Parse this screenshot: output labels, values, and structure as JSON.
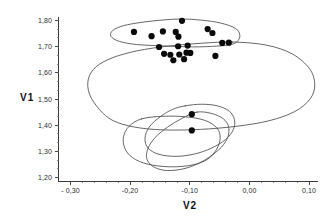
{
  "chart_data": {
    "type": "scatter",
    "title": "",
    "xlabel": "V2",
    "ylabel": "V1",
    "xlim": [
      -0.32,
      0.115
    ],
    "ylim": [
      1.185,
      1.815
    ],
    "grid": false,
    "legend": "none",
    "xticks": [
      -0.3,
      -0.2,
      -0.1,
      0.0,
      0.1
    ],
    "xtick_labels": [
      "- 0,30",
      "-0,20",
      "-0,10",
      "0,00",
      "0,10"
    ],
    "yticks": [
      1.2,
      1.3,
      1.4,
      1.5,
      1.6,
      1.7,
      1.8
    ],
    "ytick_labels": [
      "1,20",
      "1,30",
      "1,40",
      "1,50",
      "1,60",
      "1,70",
      "1,80"
    ],
    "x_minor_tick_count": 4,
    "y_minor_tick_count": 2,
    "marker": "filled-circle",
    "marker_color": "#0a0a0a",
    "marker_size_px": 3.1,
    "hull_stroke_color": "#4b4b4b",
    "axis_color": "#3a3a3a",
    "series": [
      {
        "name": "group-upper",
        "points": [
          [
            -0.113,
            1.7985
          ],
          [
            -0.1935,
            1.756
          ],
          [
            -0.164,
            1.74
          ],
          [
            -0.145,
            1.758
          ],
          [
            -0.1235,
            1.756
          ],
          [
            -0.119,
            1.738
          ],
          [
            -0.07,
            1.767
          ],
          [
            -0.062,
            1.752
          ],
          [
            -0.1515,
            1.6985
          ],
          [
            -0.1195,
            1.7015
          ],
          [
            -0.1035,
            1.704
          ],
          [
            -0.0455,
            1.714
          ],
          [
            -0.0345,
            1.715
          ],
          [
            -0.143,
            1.6725
          ],
          [
            -0.1325,
            1.669
          ],
          [
            -0.1275,
            1.648
          ],
          [
            -0.1175,
            1.67
          ],
          [
            -0.1055,
            1.677
          ],
          [
            -0.099,
            1.676
          ],
          [
            -0.1095,
            1.652
          ],
          [
            -0.057,
            1.6645
          ]
        ]
      },
      {
        "name": "group-lower",
        "points": [
          [
            -0.0965,
            1.442
          ],
          [
            -0.0965,
            1.38
          ]
        ]
      }
    ],
    "hulls": [
      {
        "name": "hull-upper-cluster",
        "vertices": [
          [
            -0.113,
            1.8055
          ],
          [
            -0.08,
            1.801
          ],
          [
            -0.048,
            1.79
          ],
          [
            -0.023,
            1.769
          ],
          [
            -0.016,
            1.743
          ],
          [
            -0.021,
            1.718
          ],
          [
            -0.035,
            1.706
          ],
          [
            -0.062,
            1.701
          ],
          [
            -0.095,
            1.699
          ],
          [
            -0.142,
            1.7025
          ],
          [
            -0.189,
            1.708
          ],
          [
            -0.218,
            1.72
          ],
          [
            -0.232,
            1.739
          ],
          [
            -0.229,
            1.762
          ],
          [
            -0.211,
            1.78
          ],
          [
            -0.18,
            1.793
          ],
          [
            -0.146,
            1.8015
          ]
        ]
      },
      {
        "name": "hull-middle-large",
        "vertices": [
          [
            -0.028,
            1.7175
          ],
          [
            0.028,
            1.706
          ],
          [
            0.072,
            1.672
          ],
          [
            0.101,
            1.615
          ],
          [
            0.1095,
            1.555
          ],
          [
            0.102,
            1.501
          ],
          [
            0.076,
            1.452
          ],
          [
            0.033,
            1.417
          ],
          [
            -0.021,
            1.396
          ],
          [
            -0.082,
            1.384
          ],
          [
            -0.144,
            1.382
          ],
          [
            -0.193,
            1.393
          ],
          [
            -0.229,
            1.418
          ],
          [
            -0.251,
            1.459
          ],
          [
            -0.268,
            1.518
          ],
          [
            -0.27,
            1.576
          ],
          [
            -0.257,
            1.623
          ],
          [
            -0.229,
            1.658
          ],
          [
            -0.188,
            1.684
          ],
          [
            -0.136,
            1.702
          ],
          [
            -0.08,
            1.713
          ]
        ]
      },
      {
        "name": "hull-lower-left",
        "vertices": [
          [
            -0.181,
            1.424
          ],
          [
            -0.145,
            1.434
          ],
          [
            -0.107,
            1.432
          ],
          [
            -0.074,
            1.418
          ],
          [
            -0.054,
            1.388
          ],
          [
            -0.049,
            1.35
          ],
          [
            -0.055,
            1.308
          ],
          [
            -0.07,
            1.27
          ],
          [
            -0.096,
            1.248
          ],
          [
            -0.132,
            1.241
          ],
          [
            -0.17,
            1.251
          ],
          [
            -0.196,
            1.276
          ],
          [
            -0.209,
            1.313
          ],
          [
            -0.211,
            1.356
          ],
          [
            -0.202,
            1.395
          ]
        ]
      },
      {
        "name": "hull-lower-mid",
        "vertices": [
          [
            -0.1075,
            1.474
          ],
          [
            -0.08,
            1.48
          ],
          [
            -0.054,
            1.474
          ],
          [
            -0.034,
            1.454
          ],
          [
            -0.025,
            1.421
          ],
          [
            -0.027,
            1.383
          ],
          [
            -0.04,
            1.345
          ],
          [
            -0.064,
            1.312
          ],
          [
            -0.092,
            1.29
          ],
          [
            -0.123,
            1.281
          ],
          [
            -0.152,
            1.289
          ],
          [
            -0.17,
            1.313
          ],
          [
            -0.175,
            1.35
          ],
          [
            -0.168,
            1.393
          ],
          [
            -0.149,
            1.433
          ],
          [
            -0.129,
            1.46
          ]
        ]
      },
      {
        "name": "hull-lower-right",
        "vertices": [
          [
            -0.088,
            1.45
          ],
          [
            -0.064,
            1.445
          ],
          [
            -0.044,
            1.425
          ],
          [
            -0.035,
            1.395
          ],
          [
            -0.036,
            1.356
          ],
          [
            -0.047,
            1.316
          ],
          [
            -0.068,
            1.277
          ],
          [
            -0.092,
            1.247
          ],
          [
            -0.118,
            1.23
          ],
          [
            -0.143,
            1.228
          ],
          [
            -0.162,
            1.243
          ],
          [
            -0.172,
            1.272
          ],
          [
            -0.17,
            1.311
          ],
          [
            -0.158,
            1.353
          ],
          [
            -0.137,
            1.393
          ],
          [
            -0.113,
            1.426
          ]
        ]
      }
    ]
  },
  "axes": {
    "y_title": "V1",
    "x_title": "V2"
  }
}
